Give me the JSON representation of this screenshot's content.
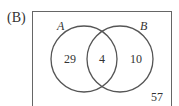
{
  "figure": {
    "option_label": "(B)",
    "sets": [
      {
        "name": "A",
        "only_count": "29"
      },
      {
        "name": "B",
        "only_count": "10"
      }
    ],
    "intersection_count": "4",
    "outside_count": "57"
  },
  "colors": {
    "stroke": "#555555",
    "text": "#333333",
    "background": "#ffffff"
  }
}
